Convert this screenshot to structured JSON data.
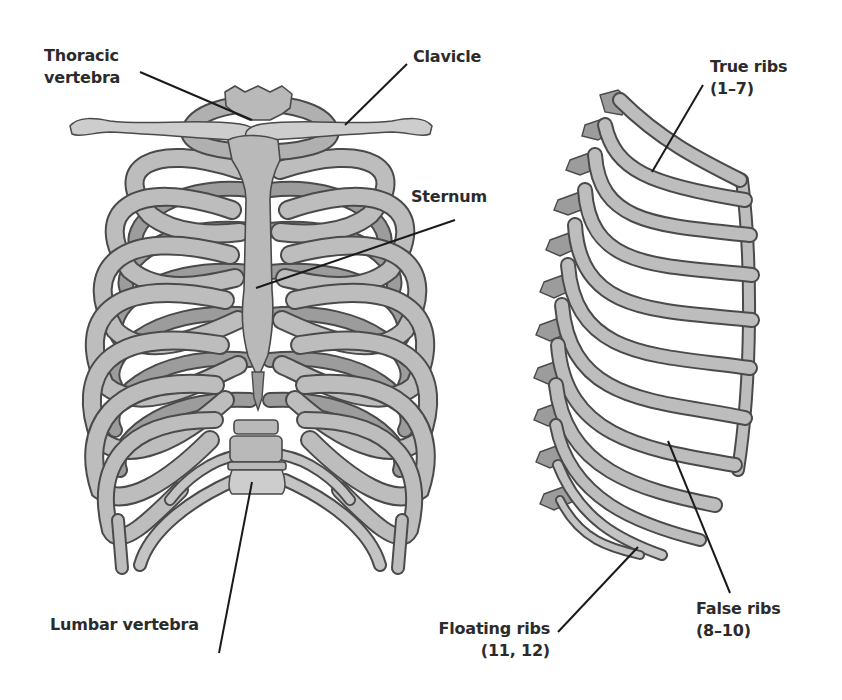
{
  "diagram": {
    "views": [
      {
        "name": "front",
        "description": "Anterior view of rib cage"
      },
      {
        "name": "side",
        "description": "Lateral view of rib cage"
      }
    ],
    "colors": {
      "background": "#ffffff",
      "bone": "#b9b9b9",
      "bone_dark": "#9c9c9c",
      "bone_light": "#cdcdcd",
      "outline": "#4a4a4a",
      "text": "#2b2b2b",
      "leader": "#1a1a1a"
    }
  },
  "labels": {
    "thoracic_vertebra": {
      "line1": "Thoracic",
      "line2": "vertebra"
    },
    "clavicle": {
      "line1": "Clavicle"
    },
    "sternum": {
      "line1": "Sternum"
    },
    "lumbar_vertebra": {
      "line1": "Lumbar vertebra"
    },
    "true_ribs": {
      "line1": "True ribs",
      "line2": "(1–7)"
    },
    "false_ribs": {
      "line1": "False ribs",
      "line2": "(8–10)"
    },
    "floating_ribs": {
      "line1": "Floating ribs",
      "line2": "(11, 12)"
    }
  }
}
